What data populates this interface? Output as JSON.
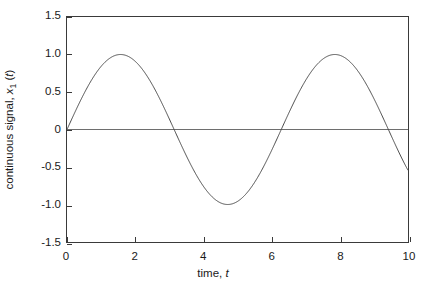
{
  "figure": {
    "background_color": "#ffffff",
    "frame_color": "#3a3a3a",
    "curve_color": "#4a4a4a",
    "zero_line_color": "#6e6e6e"
  },
  "axes": {
    "x": {
      "title_prefix": "time, ",
      "title_variable": "t",
      "ticks": [
        "0",
        "2",
        "4",
        "6",
        "8",
        "10"
      ],
      "tick_values": [
        0,
        2,
        4,
        6,
        8,
        10
      ],
      "range": [
        0,
        10
      ]
    },
    "y": {
      "title_prefix": "continuous signal, ",
      "title_variable": "x",
      "title_subscript": "1",
      "title_suffix_open": " (",
      "title_suffix_variable": "t",
      "title_suffix_close": ")",
      "ticks": [
        "1.5",
        "1.0",
        "0.5",
        "0",
        "-0.5",
        "-1.0",
        "-1.5"
      ],
      "tick_values": [
        1.5,
        1.0,
        0.5,
        0,
        -0.5,
        -1.0,
        -1.5
      ],
      "range": [
        -1.5,
        1.5
      ]
    }
  },
  "chart_data": {
    "type": "line",
    "title": "",
    "subtitle": "",
    "xlabel": "time, t",
    "ylabel": "continuous signal, x1(t)",
    "xlim": [
      0,
      10
    ],
    "ylim": [
      -1.5,
      1.5
    ],
    "xticks": [
      0,
      2,
      4,
      6,
      8,
      10
    ],
    "yticks": [
      -1.5,
      -1.0,
      -0.5,
      0,
      0.5,
      1.0,
      1.5
    ],
    "grid": false,
    "legend": null,
    "legend_position": "none",
    "annotations": [],
    "reference_lines": [
      {
        "orientation": "horizontal",
        "value": 0,
        "style": "solid"
      }
    ],
    "series": [
      {
        "name": "x1(t) = sin(t)",
        "expression": "sin(t)",
        "x": [
          0,
          0.2,
          0.4,
          0.6,
          0.8,
          1.0,
          1.2,
          1.4,
          1.5708,
          1.8,
          2.0,
          2.2,
          2.4,
          2.6,
          2.8,
          3.0,
          3.1416,
          3.4,
          3.6,
          3.8,
          4.0,
          4.2,
          4.4,
          4.6,
          4.7124,
          5.0,
          5.2,
          5.4,
          5.6,
          5.8,
          6.0,
          6.2,
          6.2832,
          6.6,
          6.8,
          7.0,
          7.2,
          7.4,
          7.6,
          7.8,
          7.854,
          8.2,
          8.4,
          8.6,
          8.8,
          9.0,
          9.2,
          9.4,
          9.4248,
          9.6,
          9.8,
          10.0
        ],
        "y": [
          0,
          0.199,
          0.389,
          0.565,
          0.717,
          0.841,
          0.932,
          0.985,
          1.0,
          0.974,
          0.909,
          0.808,
          0.675,
          0.516,
          0.335,
          0.141,
          0,
          -0.256,
          -0.443,
          -0.612,
          -0.757,
          -0.872,
          -0.952,
          -0.994,
          -1.0,
          -0.959,
          -0.883,
          -0.773,
          -0.631,
          -0.465,
          -0.279,
          -0.083,
          0,
          0.311,
          0.495,
          0.657,
          0.794,
          0.899,
          0.969,
          0.999,
          1.0,
          0.941,
          0.855,
          0.736,
          0.585,
          0.412,
          0.223,
          0.024,
          0,
          -0.175,
          -0.366,
          -0.544
        ]
      }
    ]
  }
}
